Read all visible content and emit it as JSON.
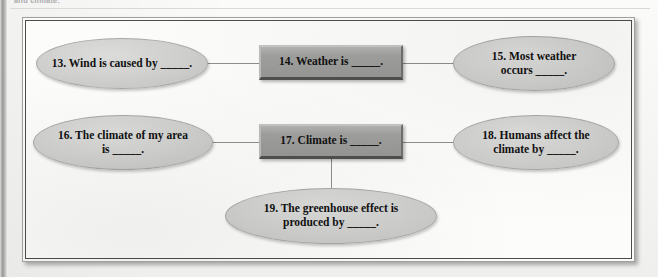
{
  "page": {
    "top_fragment": "and climate.",
    "background_color": "#f6f6f4",
    "frame_border_color": "#4c4c4c"
  },
  "diagram": {
    "type": "concept-map",
    "node_fill_oval": "#cfcfcd",
    "node_fill_box": "#9f9f9d",
    "connector_color": "#8e8e8c",
    "nodes": [
      {
        "id": "13",
        "shape": "oval",
        "text": "13. Wind is caused by _____."
      },
      {
        "id": "14",
        "shape": "box",
        "text": "14. Weather is _____."
      },
      {
        "id": "15",
        "shape": "oval",
        "text": "15. Most weather\noccurs _____."
      },
      {
        "id": "16",
        "shape": "oval",
        "text": "16. The climate of my area\nis _____."
      },
      {
        "id": "17",
        "shape": "box",
        "text": "17. Climate is _____."
      },
      {
        "id": "18",
        "shape": "oval",
        "text": "18. Humans affect the\nclimate by _____."
      },
      {
        "id": "19",
        "shape": "oval",
        "text": "19. The greenhouse effect is\nproduced by _____."
      }
    ],
    "connectors": [
      {
        "from": "13",
        "to": "14",
        "orientation": "horizontal"
      },
      {
        "from": "14",
        "to": "15",
        "orientation": "horizontal"
      },
      {
        "from": "16",
        "to": "17",
        "orientation": "horizontal"
      },
      {
        "from": "17",
        "to": "18",
        "orientation": "horizontal"
      },
      {
        "from": "17",
        "to": "19",
        "orientation": "vertical"
      }
    ]
  }
}
